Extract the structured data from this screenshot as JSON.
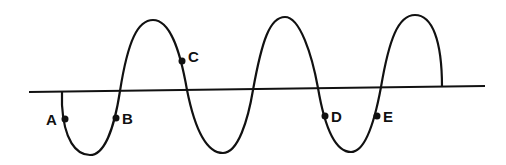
{
  "diagram": {
    "type": "transverse-wave",
    "points": [
      {
        "label": "A",
        "x": 65,
        "y": 119,
        "lx": 46,
        "ly": 125
      },
      {
        "label": "B",
        "x": 116,
        "y": 118,
        "lx": 122,
        "ly": 124
      },
      {
        "label": "C",
        "x": 182,
        "y": 61,
        "lx": 187,
        "ly": 61
      },
      {
        "label": "D",
        "x": 325,
        "y": 116,
        "lx": 331,
        "ly": 122
      },
      {
        "label": "E",
        "x": 377,
        "y": 116,
        "lx": 383,
        "ly": 122
      }
    ],
    "colors": {
      "line": "#111111",
      "background": "#ffffff"
    }
  }
}
